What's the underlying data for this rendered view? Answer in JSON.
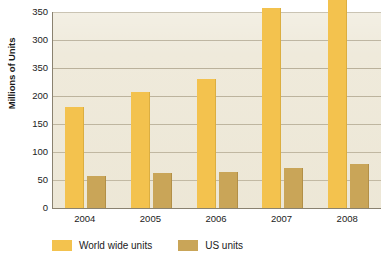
{
  "chart_data": {
    "type": "bar",
    "title": "",
    "xlabel": "",
    "ylabel": "Millions of Units",
    "categories": [
      "2004",
      "2005",
      "2006",
      "2007",
      "2008"
    ],
    "ylim": [
      0,
      350
    ],
    "ytick_labels": [
      "350",
      "300",
      "350",
      "200",
      "150",
      "100",
      "50",
      "0"
    ],
    "ytick_values": [
      350,
      300,
      250,
      200,
      150,
      100,
      50,
      0
    ],
    "ytick_note": "third label from top is printed as 350 in the original; gridline position corresponds to 250",
    "grid": true,
    "legend_position": "bottom-left",
    "series": [
      {
        "name": "World wide units",
        "color": "#F3C24E",
        "values": [
          180,
          208,
          230,
          357,
          385
        ]
      },
      {
        "name": "US units",
        "color": "#C9A558",
        "values": [
          57,
          63,
          65,
          72,
          79
        ]
      }
    ],
    "plot_background": "#EFEADB",
    "axis_color": "#8A8270",
    "gridline_color": "#B9B09A"
  }
}
